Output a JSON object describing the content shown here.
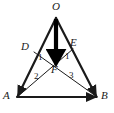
{
  "figure": {
    "width": 114,
    "height": 113,
    "background_color": "#ffffff",
    "stroke_color": "#1a1a1a",
    "vector_color": "#000000"
  },
  "points": [
    {
      "id": "O",
      "label": "O",
      "x": 56,
      "y": 18,
      "label_x": 52,
      "label_y": 2
    },
    {
      "id": "A",
      "label": "A",
      "x": 17,
      "y": 97,
      "label_x": 3,
      "label_y": 92
    },
    {
      "id": "B",
      "label": "B",
      "x": 97,
      "y": 97,
      "label_x": 101,
      "label_y": 92
    },
    {
      "id": "D",
      "label": "D",
      "x": 34,
      "y": 52,
      "label_x": 21,
      "label_y": 42
    },
    {
      "id": "E",
      "label": "E",
      "x": 73,
      "y": 49,
      "label_x": 71,
      "label_y": 38
    },
    {
      "id": "F",
      "label": "F",
      "x": 56,
      "y": 63,
      "label_x": 51,
      "label_y": 66
    }
  ],
  "angle_marks": [
    {
      "id": "angle-1-left",
      "label": "1",
      "x": 39,
      "y": 55
    },
    {
      "id": "angle-1-right",
      "label": "1",
      "x": 66,
      "y": 54
    },
    {
      "id": "angle-2",
      "label": "2",
      "x": 35,
      "y": 74
    },
    {
      "id": "angle-3",
      "label": "3",
      "x": 70,
      "y": 73
    }
  ],
  "segments": [
    {
      "id": "OA",
      "from": "O",
      "to": "A",
      "kind": "triangle-side",
      "width": 2.2
    },
    {
      "id": "OB",
      "from": "O",
      "to": "B",
      "kind": "triangle-side",
      "width": 2.2
    },
    {
      "id": "AB",
      "from": "A",
      "to": "B",
      "kind": "triangle-side",
      "width": 2.2
    },
    {
      "id": "DB",
      "from": "D",
      "to": "B",
      "kind": "cevian",
      "width": 1
    },
    {
      "id": "EA",
      "from": "E",
      "to": "A",
      "kind": "cevian",
      "width": 1
    }
  ],
  "vectors": [
    {
      "id": "OF",
      "from": "O",
      "to": "F",
      "kind": "arrow",
      "width": 4.2,
      "label": ""
    }
  ]
}
